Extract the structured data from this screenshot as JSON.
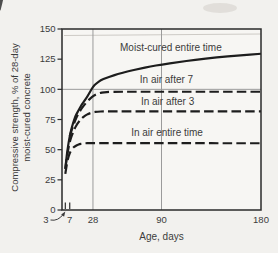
{
  "colors": {
    "paper": "#f2f1ee",
    "plot_bg": "#f7f6f3",
    "ink": "#1d1d1d",
    "box": "#2a2a2a",
    "grid": "#9b9b9b",
    "text": "#3c3c3c",
    "artifact": "#c9c6c1"
  },
  "chart_data": {
    "type": "line",
    "title": "",
    "xlabel": "Age, days",
    "ylabel": [
      "Compressive strength, % of 28-day",
      "moist-cured concrete"
    ],
    "xlim": [
      0,
      180
    ],
    "ylim": [
      0,
      150
    ],
    "grid": "partial",
    "legend_position": "inline-labels",
    "x_ticks": [
      {
        "label": "3",
        "day": 3,
        "arrow": true
      },
      {
        "label": "7",
        "day": 7
      },
      {
        "label": "28",
        "day": 28
      },
      {
        "label": "90",
        "day": 90
      },
      {
        "label": "180",
        "day": 180
      }
    ],
    "y_ticks": [
      0,
      25,
      50,
      75,
      100,
      125,
      150
    ],
    "x_gridlines_days": [
      28,
      90
    ],
    "y_gridlines_values": [
      100
    ],
    "inner_x_tick_days": [
      3,
      7
    ],
    "series": [
      {
        "name": "Moist-cured entire time",
        "style": "solid",
        "label_at": [
          98.5,
          135
        ],
        "points": [
          [
            3,
            34
          ],
          [
            4,
            43
          ],
          [
            5,
            50
          ],
          [
            6,
            56
          ],
          [
            7,
            61
          ],
          [
            8,
            65.5
          ],
          [
            10,
            72
          ],
          [
            12,
            77.5
          ],
          [
            14,
            81
          ],
          [
            16,
            84.5
          ],
          [
            18,
            87.5
          ],
          [
            20,
            90
          ],
          [
            23,
            94
          ],
          [
            26,
            99
          ],
          [
            28,
            102
          ],
          [
            31,
            105
          ],
          [
            35,
            107.5
          ],
          [
            40,
            109.5
          ],
          [
            45,
            111
          ],
          [
            50,
            112.5
          ],
          [
            60,
            115
          ],
          [
            70,
            117
          ],
          [
            80,
            119
          ],
          [
            90,
            120.5
          ],
          [
            105,
            122.5
          ],
          [
            120,
            124.5
          ],
          [
            140,
            126.5
          ],
          [
            160,
            128
          ],
          [
            180,
            129.5
          ]
        ]
      },
      {
        "name": "In air after 7",
        "style": "dashed",
        "label_at": [
          94.5,
          108
        ],
        "points": [
          [
            7,
            61
          ],
          [
            9,
            67
          ],
          [
            11,
            72
          ],
          [
            13,
            76.5
          ],
          [
            15,
            80
          ],
          [
            18,
            84.5
          ],
          [
            21,
            88
          ],
          [
            24,
            91
          ],
          [
            27,
            93.5
          ],
          [
            30,
            95.5
          ],
          [
            34,
            97
          ],
          [
            38,
            97.6
          ],
          [
            43,
            97.9
          ],
          [
            50,
            98
          ],
          [
            60,
            98
          ],
          [
            90,
            98
          ],
          [
            120,
            98
          ],
          [
            150,
            98
          ],
          [
            180,
            98
          ]
        ]
      },
      {
        "name": "In air after 3",
        "style": "dashed",
        "label_at": [
          95.5,
          90
        ],
        "points": [
          [
            3,
            34
          ],
          [
            4,
            41
          ],
          [
            5,
            47
          ],
          [
            6,
            52
          ],
          [
            7,
            56
          ],
          [
            8,
            59.5
          ],
          [
            10,
            64.5
          ],
          [
            12,
            68.5
          ],
          [
            14,
            71.5
          ],
          [
            16,
            74
          ],
          [
            18,
            76
          ],
          [
            21,
            78.3
          ],
          [
            24,
            79.8
          ],
          [
            28,
            81
          ],
          [
            32,
            81.5
          ],
          [
            38,
            81.8
          ],
          [
            50,
            81.8
          ],
          [
            70,
            81.8
          ],
          [
            90,
            81.8
          ],
          [
            120,
            81.8
          ],
          [
            150,
            81.8
          ],
          [
            180,
            81.8
          ]
        ]
      },
      {
        "name": "In air entire time",
        "style": "dashed",
        "label_at": [
          95,
          64.5
        ],
        "points": [
          [
            3,
            30
          ],
          [
            4,
            36
          ],
          [
            5,
            41
          ],
          [
            6,
            44.5
          ],
          [
            7,
            47
          ],
          [
            8,
            49
          ],
          [
            10,
            51.5
          ],
          [
            12,
            53
          ],
          [
            14,
            54
          ],
          [
            16,
            54.7
          ],
          [
            18,
            55
          ],
          [
            21,
            55.3
          ],
          [
            25,
            55.5
          ],
          [
            30,
            55.5
          ],
          [
            40,
            55.5
          ],
          [
            60,
            55.5
          ],
          [
            90,
            55.5
          ],
          [
            120,
            55.4
          ],
          [
            150,
            55.3
          ],
          [
            180,
            55.3
          ]
        ]
      }
    ]
  }
}
